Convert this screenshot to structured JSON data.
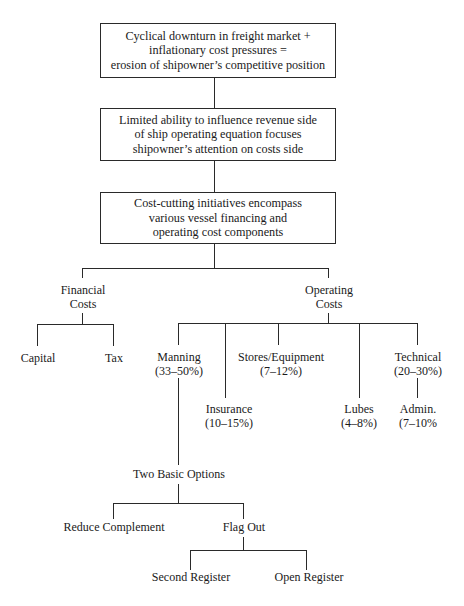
{
  "diagram": {
    "type": "hierarchical flowchart",
    "boxes": [
      {
        "id": "box-1",
        "lines": [
          "Cyclical downturn in freight market +",
          "inflationary cost pressures =",
          "erosion of shipowner’s competitive position"
        ]
      },
      {
        "id": "box-2",
        "lines": [
          "Limited ability to influence revenue side",
          "of ship operating equation focuses",
          "shipowner’s attention on costs side"
        ]
      },
      {
        "id": "box-3",
        "lines": [
          "Cost-cutting initiatives encompass",
          "various vessel financing and",
          "operating cost components"
        ]
      }
    ],
    "branches": {
      "financial": {
        "lines": [
          "Financial",
          "Costs"
        ],
        "children": [
          {
            "label": "Capital"
          },
          {
            "label": "Tax"
          }
        ]
      },
      "operating": {
        "lines": [
          "Operating",
          "Costs"
        ],
        "children": [
          {
            "id": "manning",
            "lines": [
              "Manning",
              "(33–50%)"
            ]
          },
          {
            "id": "insurance",
            "lines": [
              "Insurance",
              "(10–15%)"
            ]
          },
          {
            "id": "stores",
            "lines": [
              "Stores/Equipment",
              "(7–12%)"
            ]
          },
          {
            "id": "lubes",
            "lines": [
              "Lubes",
              "(4–8%)"
            ]
          },
          {
            "id": "technical",
            "lines": [
              "Technical",
              "(20–30%)"
            ]
          },
          {
            "id": "admin",
            "lines": [
              "Admin.",
              "(7–10%"
            ]
          }
        ]
      }
    },
    "manning_options": {
      "label": "Two Basic Options",
      "children": [
        {
          "label": "Reduce Complement"
        },
        {
          "label": "Flag Out",
          "children": [
            {
              "label": "Second Register"
            },
            {
              "label": "Open Register"
            }
          ]
        }
      ]
    }
  }
}
